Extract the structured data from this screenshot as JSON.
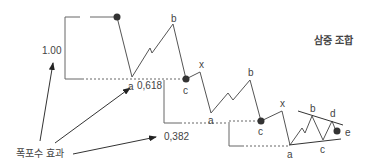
{
  "title": "삼중 조합",
  "caption": "폭포수 효과",
  "levels": {
    "level_1": "1.00",
    "level_2": "0,618",
    "level_3": "0,382"
  },
  "wave_labels": {
    "first": {
      "a": "a",
      "b": "b",
      "c": "c"
    },
    "second": {
      "x": "x",
      "a": "a",
      "b": "b",
      "c": "c"
    },
    "triangle": {
      "x": "x",
      "a": "a",
      "b": "b",
      "c": "c",
      "d": "d",
      "e": "e"
    }
  },
  "colors": {
    "line": "#555555",
    "dot": "#333333",
    "text": "#444444"
  }
}
